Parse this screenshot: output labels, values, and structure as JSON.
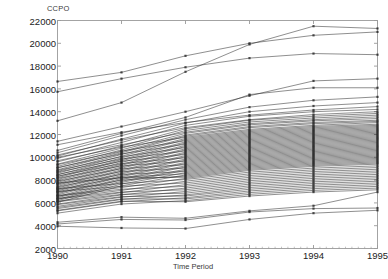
{
  "chart_data": {
    "type": "line",
    "title": "",
    "ylabel": "CCPO",
    "xlabel": "Time Period",
    "grid": false,
    "legend": "none",
    "x": [
      1990,
      1991,
      1992,
      1993,
      1994,
      1995
    ],
    "xtick_labels": [
      "1990",
      "1991",
      "1992",
      "1993",
      "1994",
      "1995"
    ],
    "xlim": [
      1990,
      1995
    ],
    "ylim": [
      2000,
      22000
    ],
    "ytick_values": [
      2000,
      4000,
      6000,
      8000,
      10000,
      12000,
      14000,
      16000,
      18000,
      20000,
      22000
    ],
    "ytick_labels": [
      "2000",
      "4000",
      "6000",
      "8000",
      "10000",
      "12000",
      "14000",
      "16000",
      "18000",
      "20000",
      "22000"
    ],
    "marker": "square",
    "line_color": "#2b2b2b",
    "axis_color": "#9a9a9a",
    "series": [
      {
        "name": "s01",
        "values": [
          13200,
          14800,
          17500,
          19900,
          21500,
          21300
        ]
      },
      {
        "name": "s02",
        "values": [
          16650,
          17450,
          18900,
          20000,
          20700,
          21000
        ]
      },
      {
        "name": "s03",
        "values": [
          15750,
          16900,
          17900,
          18700,
          19100,
          19000
        ]
      },
      {
        "name": "s04",
        "values": [
          11400,
          12700,
          14000,
          15400,
          16700,
          16900
        ]
      },
      {
        "name": "s05",
        "values": [
          10600,
          12100,
          13500,
          15500,
          16100,
          16100
        ]
      },
      {
        "name": "s06",
        "values": [
          10400,
          11900,
          13300,
          14400,
          15000,
          15300
        ]
      },
      {
        "name": "s07",
        "values": [
          10100,
          11600,
          13000,
          14000,
          14500,
          14800
        ]
      },
      {
        "name": "s08",
        "values": [
          11100,
          12200,
          13050,
          13700,
          14150,
          14450
        ]
      },
      {
        "name": "s09",
        "values": [
          9900,
          11300,
          12800,
          13600,
          14000,
          14200
        ]
      },
      {
        "name": "s10",
        "values": [
          10200,
          11500,
          12600,
          13300,
          13750,
          14000
        ]
      },
      {
        "name": "s11",
        "values": [
          9600,
          11000,
          12500,
          13250,
          13600,
          13850
        ]
      },
      {
        "name": "s12",
        "values": [
          9400,
          10800,
          12350,
          13100,
          13450,
          13700
        ]
      },
      {
        "name": "s13",
        "values": [
          10000,
          11100,
          12200,
          12950,
          13300,
          13550
        ]
      },
      {
        "name": "s14",
        "values": [
          9200,
          10650,
          12100,
          12850,
          13200,
          13400
        ]
      },
      {
        "name": "s15",
        "values": [
          9050,
          10500,
          11950,
          12700,
          13050,
          13250
        ]
      },
      {
        "name": "s16",
        "values": [
          8900,
          10400,
          11850,
          12600,
          12950,
          13150
        ]
      },
      {
        "name": "s17",
        "values": [
          9700,
          10900,
          11750,
          12450,
          12800,
          13050
        ]
      },
      {
        "name": "s18",
        "values": [
          8750,
          10250,
          11650,
          12350,
          12700,
          12900
        ]
      },
      {
        "name": "s19",
        "values": [
          8600,
          10100,
          11550,
          12250,
          12600,
          12800
        ]
      },
      {
        "name": "s20",
        "values": [
          9350,
          10550,
          11450,
          12150,
          12500,
          12700
        ]
      },
      {
        "name": "s21",
        "values": [
          8450,
          9950,
          11350,
          12050,
          12400,
          12600
        ]
      },
      {
        "name": "s22",
        "values": [
          8300,
          9800,
          11250,
          11950,
          12300,
          12500
        ]
      },
      {
        "name": "s23",
        "values": [
          9100,
          10300,
          11150,
          11850,
          12200,
          12400
        ]
      },
      {
        "name": "s24",
        "values": [
          8200,
          9700,
          11050,
          11750,
          12100,
          12300
        ]
      },
      {
        "name": "s25",
        "values": [
          8050,
          9550,
          10950,
          11650,
          12000,
          12200
        ]
      },
      {
        "name": "s26",
        "values": [
          8850,
          10050,
          10850,
          11550,
          11900,
          12100
        ]
      },
      {
        "name": "s27",
        "values": [
          7950,
          9400,
          10750,
          11450,
          11800,
          12000
        ]
      },
      {
        "name": "s28",
        "values": [
          7800,
          9300,
          10650,
          11350,
          11700,
          11900
        ]
      },
      {
        "name": "s29",
        "values": [
          8700,
          9850,
          10550,
          11250,
          11600,
          11800
        ]
      },
      {
        "name": "s30",
        "values": [
          7700,
          9150,
          10450,
          11150,
          11500,
          11700
        ]
      },
      {
        "name": "s31",
        "values": [
          7550,
          9050,
          10350,
          11050,
          11400,
          11600
        ]
      },
      {
        "name": "s32",
        "values": [
          8500,
          9650,
          10250,
          10950,
          11300,
          11500
        ]
      },
      {
        "name": "s33",
        "values": [
          7450,
          8900,
          10150,
          10850,
          11200,
          11400
        ]
      },
      {
        "name": "s34",
        "values": [
          7300,
          8800,
          10050,
          10750,
          11100,
          11300
        ]
      },
      {
        "name": "s35",
        "values": [
          8350,
          9450,
          9950,
          10650,
          11000,
          11200
        ]
      },
      {
        "name": "s36",
        "values": [
          7200,
          8650,
          9850,
          10550,
          10900,
          11100
        ]
      },
      {
        "name": "s37",
        "values": [
          7050,
          8550,
          9750,
          10450,
          10800,
          11000
        ]
      },
      {
        "name": "s38",
        "values": [
          8150,
          9250,
          9650,
          10350,
          10700,
          10900
        ]
      },
      {
        "name": "s39",
        "values": [
          6950,
          8400,
          9550,
          10250,
          10600,
          10800
        ]
      },
      {
        "name": "s40",
        "values": [
          6800,
          8300,
          9450,
          10150,
          10500,
          10700
        ]
      },
      {
        "name": "s41",
        "values": [
          7900,
          9000,
          9350,
          10050,
          10400,
          10600
        ]
      },
      {
        "name": "s42",
        "values": [
          6700,
          8150,
          9250,
          9950,
          10300,
          10500
        ]
      },
      {
        "name": "s43",
        "values": [
          6550,
          8050,
          9150,
          9850,
          10200,
          10400
        ]
      },
      {
        "name": "s44",
        "values": [
          7650,
          8750,
          9050,
          9750,
          10100,
          10300
        ]
      },
      {
        "name": "s45",
        "values": [
          6450,
          7900,
          8950,
          9650,
          10000,
          10200
        ]
      },
      {
        "name": "s46",
        "values": [
          6300,
          7800,
          8850,
          9550,
          9900,
          10100
        ]
      },
      {
        "name": "s47",
        "values": [
          7400,
          8500,
          8750,
          9450,
          9800,
          10000
        ]
      },
      {
        "name": "s48",
        "values": [
          6200,
          7650,
          8650,
          9350,
          9700,
          9900
        ]
      },
      {
        "name": "s49",
        "values": [
          7150,
          8250,
          8550,
          9250,
          9600,
          9800
        ]
      },
      {
        "name": "s50",
        "values": [
          6050,
          7500,
          8450,
          9150,
          9500,
          9700
        ]
      },
      {
        "name": "s51",
        "values": [
          6900,
          8000,
          8350,
          9050,
          9400,
          9600
        ]
      },
      {
        "name": "s52",
        "values": [
          7750,
          8200,
          8250,
          8950,
          9300,
          9500
        ]
      },
      {
        "name": "s53",
        "values": [
          6650,
          7350,
          8150,
          8850,
          9200,
          9400
        ]
      },
      {
        "name": "s54",
        "values": [
          7250,
          7700,
          8050,
          8700,
          9050,
          9250
        ]
      },
      {
        "name": "s55",
        "values": [
          6400,
          7100,
          7900,
          8550,
          8900,
          9100
        ]
      },
      {
        "name": "s56",
        "values": [
          7000,
          7450,
          7750,
          8400,
          8750,
          8950
        ]
      },
      {
        "name": "s57",
        "values": [
          6150,
          6900,
          7600,
          8250,
          8600,
          8800
        ]
      },
      {
        "name": "s58",
        "values": [
          6600,
          7200,
          7450,
          8100,
          8450,
          8650
        ]
      },
      {
        "name": "s59",
        "values": [
          5900,
          6700,
          7300,
          7950,
          8300,
          8500
        ]
      },
      {
        "name": "s60",
        "values": [
          6350,
          6950,
          7150,
          7800,
          8150,
          8350
        ]
      },
      {
        "name": "s61",
        "values": [
          5700,
          6500,
          7000,
          7650,
          8000,
          8200
        ]
      },
      {
        "name": "s62",
        "values": [
          6100,
          6750,
          6850,
          7500,
          7850,
          8050
        ]
      },
      {
        "name": "s63",
        "values": [
          5500,
          6300,
          6700,
          7350,
          7700,
          7900
        ]
      },
      {
        "name": "s64",
        "values": [
          5850,
          6550,
          6600,
          7200,
          7550,
          7750
        ]
      },
      {
        "name": "s65",
        "values": [
          5300,
          6100,
          6450,
          7050,
          7400,
          7600
        ]
      },
      {
        "name": "s66",
        "values": [
          5600,
          6350,
          6350,
          6900,
          7250,
          7450
        ]
      },
      {
        "name": "s67",
        "values": [
          5100,
          5900,
          6200,
          6750,
          7100,
          7300
        ]
      },
      {
        "name": "s68",
        "values": [
          5350,
          6150,
          6100,
          6600,
          6950,
          7150
        ]
      },
      {
        "name": "s69",
        "values": [
          4300,
          4750,
          4650,
          5300,
          5750,
          6950
        ]
      },
      {
        "name": "s70",
        "values": [
          4150,
          4550,
          4500,
          5200,
          5500,
          5550
        ]
      },
      {
        "name": "s71",
        "values": [
          3950,
          3800,
          3750,
          4550,
          5100,
          5350
        ]
      }
    ]
  }
}
